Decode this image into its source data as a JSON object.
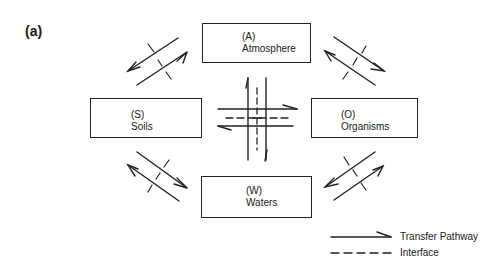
{
  "figure": {
    "panel_label": "(a)",
    "compartments": {
      "atmosphere": {
        "code": "(A)",
        "name": "Atmosphere"
      },
      "soils": {
        "code": "(S)",
        "name": "Soils"
      },
      "organisms": {
        "code": "(O)",
        "name": "Organisms"
      },
      "waters": {
        "code": "(W)",
        "name": "Waters"
      }
    },
    "pathways": [
      {
        "between": [
          "Soils",
          "Atmosphere"
        ],
        "bidirectional": true,
        "interface": true
      },
      {
        "between": [
          "Atmosphere",
          "Organisms"
        ],
        "bidirectional": true,
        "interface": true
      },
      {
        "between": [
          "Soils",
          "Waters"
        ],
        "bidirectional": true,
        "interface": true
      },
      {
        "between": [
          "Waters",
          "Organisms"
        ],
        "bidirectional": true,
        "interface": true
      },
      {
        "between": [
          "Soils",
          "Organisms"
        ],
        "bidirectional": true,
        "interface": true
      },
      {
        "between": [
          "Atmosphere",
          "Waters"
        ],
        "bidirectional": true,
        "interface": true
      }
    ],
    "legend": {
      "transfer_pathway": "Transfer Pathway",
      "interface": "Interface"
    }
  }
}
